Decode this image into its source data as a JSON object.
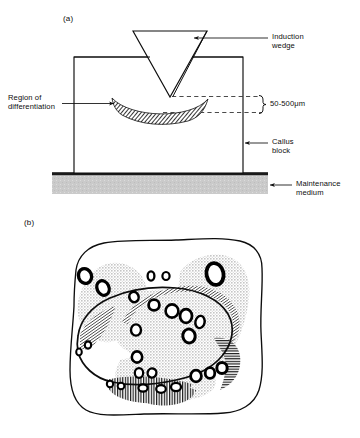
{
  "figure": {
    "title_visible": false,
    "panels": [
      {
        "tag": "(a)",
        "name": "cross-section-of-induction-wedge-on-callus-block"
      },
      {
        "tag": "(b)",
        "name": "tissue-differentiation-tracing"
      }
    ]
  },
  "panel_a": {
    "tag": "(a)",
    "labels": {
      "induction_wedge": "Induction\nwedge",
      "region_of_differentiation": "Region of\ndifferentiation",
      "dimension": "50-500μm",
      "callus_block": "Callus\nblock",
      "maintenance_medium": "Maintenance\nmedium"
    },
    "colors": {
      "line": "#0d0d0d",
      "medium_fill": "#c9c9c9",
      "medium_edge": "#1a1a1a",
      "hatch": "#111111",
      "dashed": "#2b2b2b"
    }
  },
  "panel_b": {
    "tag": "(b)",
    "colors": {
      "outline": "#0d0d0d",
      "halo_fill": "#d2d2d2",
      "hatch": "#111111",
      "vessel_fill": "#ffffff",
      "vessel_stroke": "#000000"
    }
  }
}
